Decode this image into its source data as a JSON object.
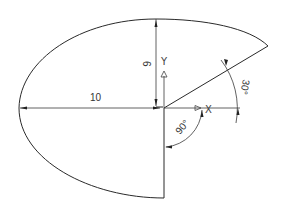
{
  "diagram": {
    "type": "elliptical-arc dimension drawing",
    "shape": "elliptical arc with one radial edge and one vertical edge",
    "center": {
      "x": 163,
      "y": 108
    },
    "dimensions": {
      "major_semi_axis": "10",
      "minor_semi_axis": "6",
      "start_angle": "90°",
      "included_angle_end": "30°"
    },
    "axes": {
      "x_label": "X",
      "y_label": "Y"
    },
    "colors": {
      "line": "#2a2a2a",
      "text": "#333333",
      "background": "#ffffff"
    }
  }
}
